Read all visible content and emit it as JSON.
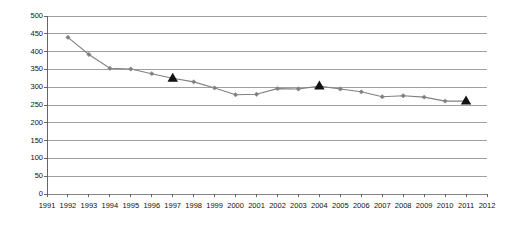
{
  "chart_data": {
    "type": "line",
    "title": "",
    "subtitle": "",
    "xlabel": "",
    "ylabel": "Fraud rate per 100,000 population",
    "xlim": [
      1991,
      2012
    ],
    "ylim": [
      0,
      500
    ],
    "ytick_step": 50,
    "grid": true,
    "legend": "none",
    "x_ticks": [
      "1991",
      "1992",
      "1993",
      "1994",
      "1995",
      "1996",
      "1997",
      "1998",
      "1999",
      "2000",
      "2001",
      "2002",
      "2003",
      "2004",
      "2005",
      "2006",
      "2007",
      "2008",
      "2009",
      "2010",
      "2011",
      "2012"
    ],
    "y_ticks": [
      "0",
      "50",
      "100",
      "150",
      "200",
      "250",
      "300",
      "350",
      "400",
      "450",
      "500"
    ],
    "series": [
      {
        "name": "Fraud rate",
        "color": "#808080",
        "marker": "diamond",
        "x": [
          1992,
          1993,
          1994,
          1995,
          1996,
          1997,
          1998,
          1999,
          2000,
          2001,
          2002,
          2003,
          2004,
          2005,
          2006,
          2007,
          2008,
          2009,
          2010,
          2011
        ],
        "values": [
          440,
          392,
          353,
          351,
          338,
          325,
          315,
          298,
          279,
          280,
          296,
          295,
          303,
          295,
          287,
          273,
          276,
          272,
          261,
          261
        ]
      }
    ],
    "highlight_markers": {
      "name": "Census year",
      "color": "#111111",
      "marker": "triangle",
      "x": [
        1997,
        2004,
        2011
      ],
      "values": [
        325,
        303,
        261
      ]
    }
  },
  "axes": {
    "y_title": "Fraud rate per 100,000 population"
  }
}
